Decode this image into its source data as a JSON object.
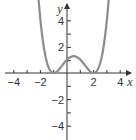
{
  "chart_data": {
    "type": "line",
    "title": "",
    "xlabel": "x",
    "ylabel": "y",
    "xlim": [
      -4.6,
      4.9
    ],
    "ylim": [
      -5.0,
      5.2
    ],
    "x_ticks": [
      -4,
      -3,
      -2,
      -1,
      1,
      2,
      3,
      4
    ],
    "x_tick_labels": [
      "-4",
      "-2",
      "2",
      "4"
    ],
    "y_ticks": [
      -5,
      -4,
      -3,
      -2,
      -1,
      1,
      2,
      3,
      4
    ],
    "y_tick_labels": [
      "4",
      "2",
      "-2",
      "-4"
    ],
    "grid": false,
    "legend": null,
    "series": [
      {
        "name": "f(x)",
        "description": "Quartic with double roots at x = -1 and x = 2, y-intercept 1, local max near (0.5, 1.27); arrows at both ends pointing upward",
        "x": [
          -2.3,
          -2,
          -1.5,
          -1,
          -0.5,
          0,
          0.5,
          1,
          1.5,
          2,
          2.5,
          3,
          3.3
        ],
        "y": [
          4.9,
          4.0,
          1.89,
          0,
          0.39,
          1.0,
          1.27,
          1.0,
          0.39,
          0,
          0.39,
          4.0,
          4.9
        ]
      }
    ],
    "colors": {
      "curve": "#8c8c8c",
      "axes": "#333333"
    }
  },
  "labels": {
    "x_axis": "x",
    "y_axis": "y",
    "xt_m4": "−4",
    "xt_m2": "−2",
    "xt_2": "2",
    "xt_4": "4",
    "yt_4": "4",
    "yt_2": "2",
    "yt_m2": "−2",
    "yt_m4": "−4"
  }
}
